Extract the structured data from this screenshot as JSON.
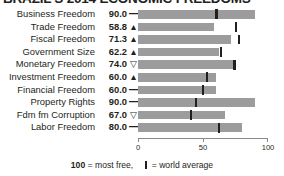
{
  "title": "BRAZIL'S 2014 ECONOMIC FREEDOMS",
  "axis": {
    "ticks": [
      "0",
      "50",
      "100"
    ],
    "min": 0,
    "max": 100
  },
  "legend": {
    "scale_value": "100",
    "scale_text": " = most free,",
    "avg_text": " = world average"
  },
  "colors": {
    "bar": "#9c9c9c",
    "marker": "#231f20",
    "text": "#231f20",
    "axis": "#8a8a8a"
  },
  "chart_data": {
    "type": "bar",
    "title": "BRAZIL'S 2014 ECONOMIC FREEDOMS",
    "xlabel": "",
    "ylabel": "",
    "xlim": [
      0,
      100
    ],
    "grid": false,
    "orientation": "horizontal",
    "categories": [
      "Business Freedom",
      "Trade Freedom",
      "Fiscal Freedom",
      "Government Size",
      "Monetary Freedom",
      "Investment Freedom",
      "Financial Freedom",
      "Property Rights",
      "Fdm fm Corruption",
      "Labor Freedom"
    ],
    "values": [
      90.0,
      58.8,
      71.3,
      62.2,
      74.0,
      60.0,
      60.0,
      90.0,
      67.0,
      80.0
    ],
    "value_labels": [
      "90.0",
      "58.8",
      "71.3",
      "62.2",
      "74.0",
      "60.0",
      "60.0",
      "90.0",
      "67.0",
      "80.0"
    ],
    "trends": [
      "flat",
      "up",
      "up",
      "up",
      "down",
      "up",
      "flat",
      "flat",
      "down",
      "flat"
    ],
    "trend_glyphs": [
      "—",
      "▲",
      "▲",
      "▲",
      "▽",
      "▲",
      "—",
      "—",
      "▽",
      "—"
    ],
    "world_average": [
      59.6,
      74.8,
      77.2,
      62.8,
      73.4,
      52.0,
      49.2,
      43.6,
      40.2,
      61.6
    ],
    "series": [
      {
        "name": "Brazil score",
        "values": [
          90.0,
          58.8,
          71.3,
          62.2,
          74.0,
          60.0,
          60.0,
          90.0,
          67.0,
          80.0
        ]
      },
      {
        "name": "World average",
        "values": [
          59.6,
          74.8,
          77.2,
          62.8,
          73.4,
          52.0,
          49.2,
          43.6,
          40.2,
          61.6
        ]
      }
    ]
  }
}
